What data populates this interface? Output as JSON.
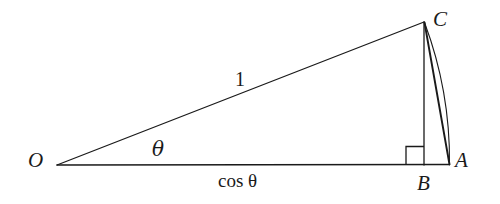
{
  "figure": {
    "background_color": "#ffffff",
    "stroke_color": "#1a1a1a",
    "width": 500,
    "height": 204
  },
  "points": {
    "O": {
      "label": "O",
      "x": 57,
      "y": 165,
      "label_x": 28,
      "label_y": 150
    },
    "A": {
      "label": "A",
      "x": 449,
      "y": 164,
      "label_x": 455,
      "label_y": 150
    },
    "B": {
      "label": "B",
      "x": 424,
      "y": 164,
      "label_x": 417,
      "label_y": 173
    },
    "C": {
      "label": "C",
      "x": 424,
      "y": 22,
      "label_x": 433,
      "label_y": 9
    }
  },
  "labels": {
    "hypotenuse": {
      "text": "1",
      "x": 235,
      "y": 69
    },
    "angle": {
      "text": "θ",
      "x": 152,
      "y": 139
    },
    "base": {
      "text": "cos θ",
      "x": 218,
      "y": 171
    }
  },
  "segments": [
    {
      "name": "ray-O-to-C",
      "from": "O",
      "to": "C",
      "stroke_width": 1.3
    },
    {
      "name": "baseline-O-to-A",
      "from": "O",
      "to": "A",
      "stroke_width": 1.3
    },
    {
      "name": "altitude-C-to-B",
      "from": "C",
      "to": "B",
      "stroke_width": 1.3
    },
    {
      "name": "chord-C-to-A",
      "from": "C",
      "to": "A",
      "stroke_width": 1.8
    }
  ],
  "arc": {
    "name": "arc-C-to-A",
    "from": "C",
    "to": "A",
    "radius": 392,
    "stroke_width": 1.1,
    "description": "circular arc of unit radius centered at O sweeping from C to A"
  },
  "right_angle_marker": {
    "name": "right-angle-at-B",
    "vertex_x": 424,
    "vertex_y": 164,
    "size": 18,
    "stroke_width": 1.3
  }
}
